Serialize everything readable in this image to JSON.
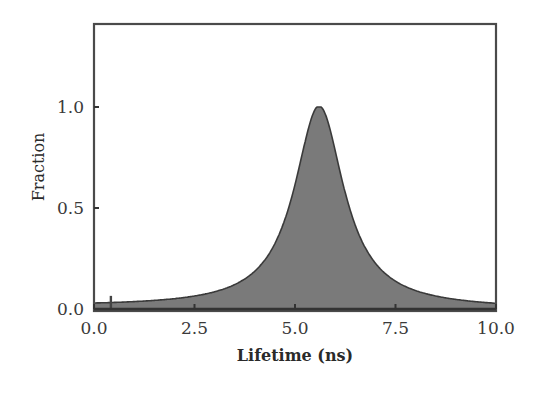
{
  "chart_data": {
    "type": "area",
    "title": "",
    "xlabel": "Lifetime (ns)",
    "ylabel": "Fraction",
    "xlim": [
      0.0,
      10.0
    ],
    "ylim": [
      0.0,
      1.42
    ],
    "grid": false,
    "legend": null,
    "x_ticks": [
      "0.0",
      "2.5",
      "5.0",
      "7.5",
      "10.0"
    ],
    "y_ticks": [
      "0.0",
      "0.5",
      "1.0"
    ],
    "series": [
      {
        "name": "Lifetime distribution",
        "peak_x": 5.6,
        "peak_y": 1.0,
        "hwhm": 0.75,
        "x": [
          0.0,
          0.5,
          1.0,
          1.5,
          2.0,
          2.5,
          3.0,
          3.5,
          4.0,
          4.25,
          4.5,
          4.75,
          5.0,
          5.2,
          5.4,
          5.6,
          5.8,
          6.0,
          6.2,
          6.45,
          6.7,
          7.0,
          7.5,
          8.0,
          8.5,
          9.0,
          9.5,
          10.0
        ],
        "y": [
          0.018,
          0.021,
          0.025,
          0.03,
          0.041,
          0.055,
          0.077,
          0.113,
          0.18,
          0.236,
          0.31,
          0.44,
          0.61,
          0.78,
          0.93,
          1.0,
          0.93,
          0.78,
          0.61,
          0.44,
          0.32,
          0.22,
          0.135,
          0.089,
          0.064,
          0.047,
          0.036,
          0.028
        ]
      },
      {
        "name": "Spike",
        "x": [
          0.42
        ],
        "y": [
          0.065
        ]
      }
    ],
    "fill_color": "#7a7a7a",
    "line_color": "#333333",
    "frame_color": "#555555"
  }
}
